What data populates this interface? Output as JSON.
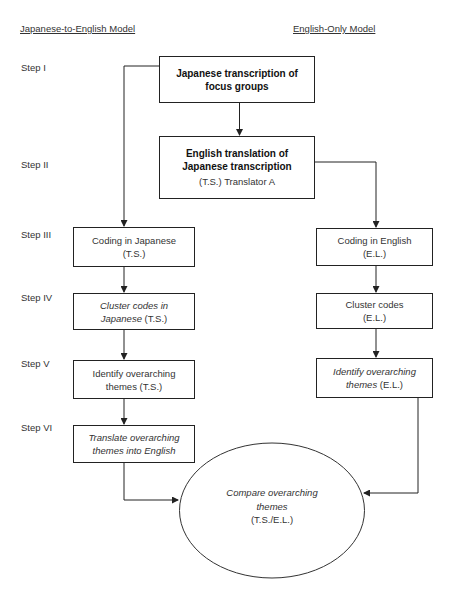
{
  "headers": {
    "left_model": "Japanese-to-English Model",
    "right_model": "English-Only Model"
  },
  "steps": [
    "Step I",
    "Step II",
    "Step III",
    "Step IV",
    "Step V",
    "Step VI"
  ],
  "nodes": {
    "japanese_transcription": {
      "line1": "Japanese transcription of",
      "line2": "focus groups"
    },
    "english_translation": {
      "line1": "English translation of",
      "line2": "Japanese transcription",
      "line3": "(T.S.) Translator A"
    },
    "coding_japanese": {
      "line1": "Coding in Japanese",
      "line2": "(T.S.)"
    },
    "cluster_japanese": {
      "line1_italic": "Cluster codes in",
      "line2_italic": "Japanese",
      "line2_suffix": " (T.S.)"
    },
    "identify_japanese": {
      "line1": "Identify overarching",
      "line2": "themes (T.S.)"
    },
    "translate_themes": {
      "line1_italic": "Translate overarching",
      "line2_italic": "themes into English"
    },
    "coding_english": {
      "line1": "Coding in English",
      "line2": "(E.L.)"
    },
    "cluster_english": {
      "line1": "Cluster codes",
      "line2": "(E.L.)"
    },
    "identify_english": {
      "line1_italic": "Identify overarching",
      "line2_italic": "themes",
      "line2_suffix": " (E.L.)"
    },
    "compare": {
      "line1_italic": "Compare overarching",
      "line2_italic": "themes",
      "line3": "(T.S./E.L.)"
    }
  },
  "colors": {
    "line": "#222222",
    "text": "#333333",
    "background": "#ffffff"
  }
}
